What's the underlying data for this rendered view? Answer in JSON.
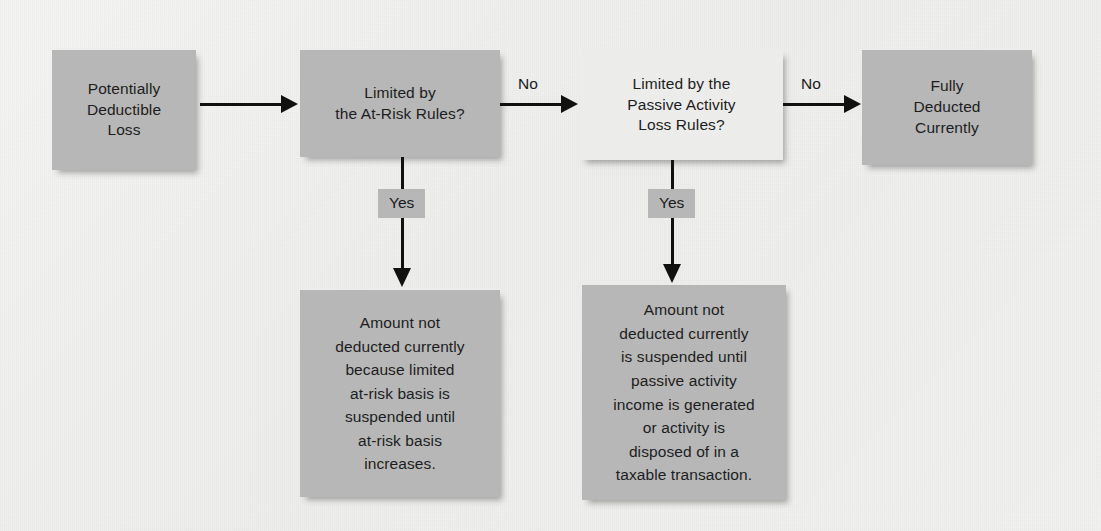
{
  "figure": {
    "background_color": "#f1f1ef",
    "box_fill_gray": "#b7b7b7",
    "box_fill_light": "#ececeb",
    "line_color": "#111111"
  },
  "nodes": {
    "start": {
      "label": "Potentially\nDeductible\nLoss",
      "fill": "#b7b7b7"
    },
    "at_risk_test": {
      "label": "Limited by\nthe At-Risk Rules?",
      "fill": "#b7b7b7"
    },
    "passive_test": {
      "label": "Limited by the\nPassive Activity\nLoss Rules?",
      "fill": "#ececeb"
    },
    "fully_deducted": {
      "label": "Fully\nDeducted\nCurrently",
      "fill": "#b7b7b7"
    },
    "at_risk_suspended": {
      "label": "Amount not\ndeducted currently\nbecause limited\nat-risk basis is\nsuspended until\nat-risk basis\nincreases.",
      "fill": "#b7b7b7"
    },
    "passive_suspended": {
      "label": "Amount not\ndeducted currently\nis suspended until\npassive activity\nincome is generated\nor activity is\ndisposed of in a\ntaxable transaction.",
      "fill": "#b7b7b7"
    }
  },
  "edges": {
    "start_to_at_risk": {
      "label": ""
    },
    "at_risk_no": {
      "label": "No"
    },
    "passive_no": {
      "label": "No"
    },
    "at_risk_yes": {
      "label": "Yes"
    },
    "passive_yes": {
      "label": "Yes"
    }
  }
}
